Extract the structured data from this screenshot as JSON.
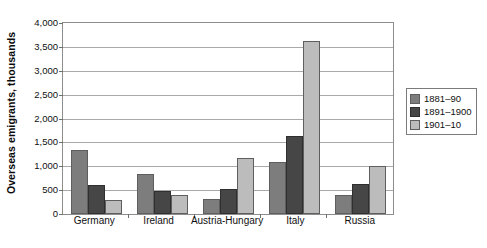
{
  "chart_data": {
    "type": "bar",
    "title": "",
    "xlabel": "",
    "ylabel": "Overseas emigrants, thousands",
    "ylim": [
      0,
      4000
    ],
    "ytick_step": 500,
    "yticks": [
      "0",
      "500",
      "1,000",
      "1,500",
      "2,000",
      "2,500",
      "3,000",
      "3,500",
      "4,000"
    ],
    "grid": true,
    "legend_position": "right",
    "categories": [
      "Germany",
      "Ireland",
      "Austria-Hungary",
      "Italy",
      "Russia"
    ],
    "series": [
      {
        "name": "1881–90",
        "color": "#7d7d7d",
        "values": [
          1350,
          840,
          310,
          1080,
          400
        ]
      },
      {
        "name": "1891–1900",
        "color": "#464646",
        "values": [
          600,
          480,
          530,
          1630,
          620
        ]
      },
      {
        "name": "1901–10",
        "color": "#bcbcbc",
        "values": [
          300,
          390,
          1180,
          3620,
          1000
        ]
      }
    ]
  },
  "legend": {
    "entries": [
      "1881–90",
      "1891–1900",
      "1901–10"
    ]
  },
  "colors": {
    "series_1": "#7d7d7d",
    "series_2": "#464646",
    "series_3": "#bcbcbc",
    "axis": "#8d8d8d",
    "gridline": "#a9a9a9",
    "text": "#101010",
    "background": "#ffffff"
  }
}
